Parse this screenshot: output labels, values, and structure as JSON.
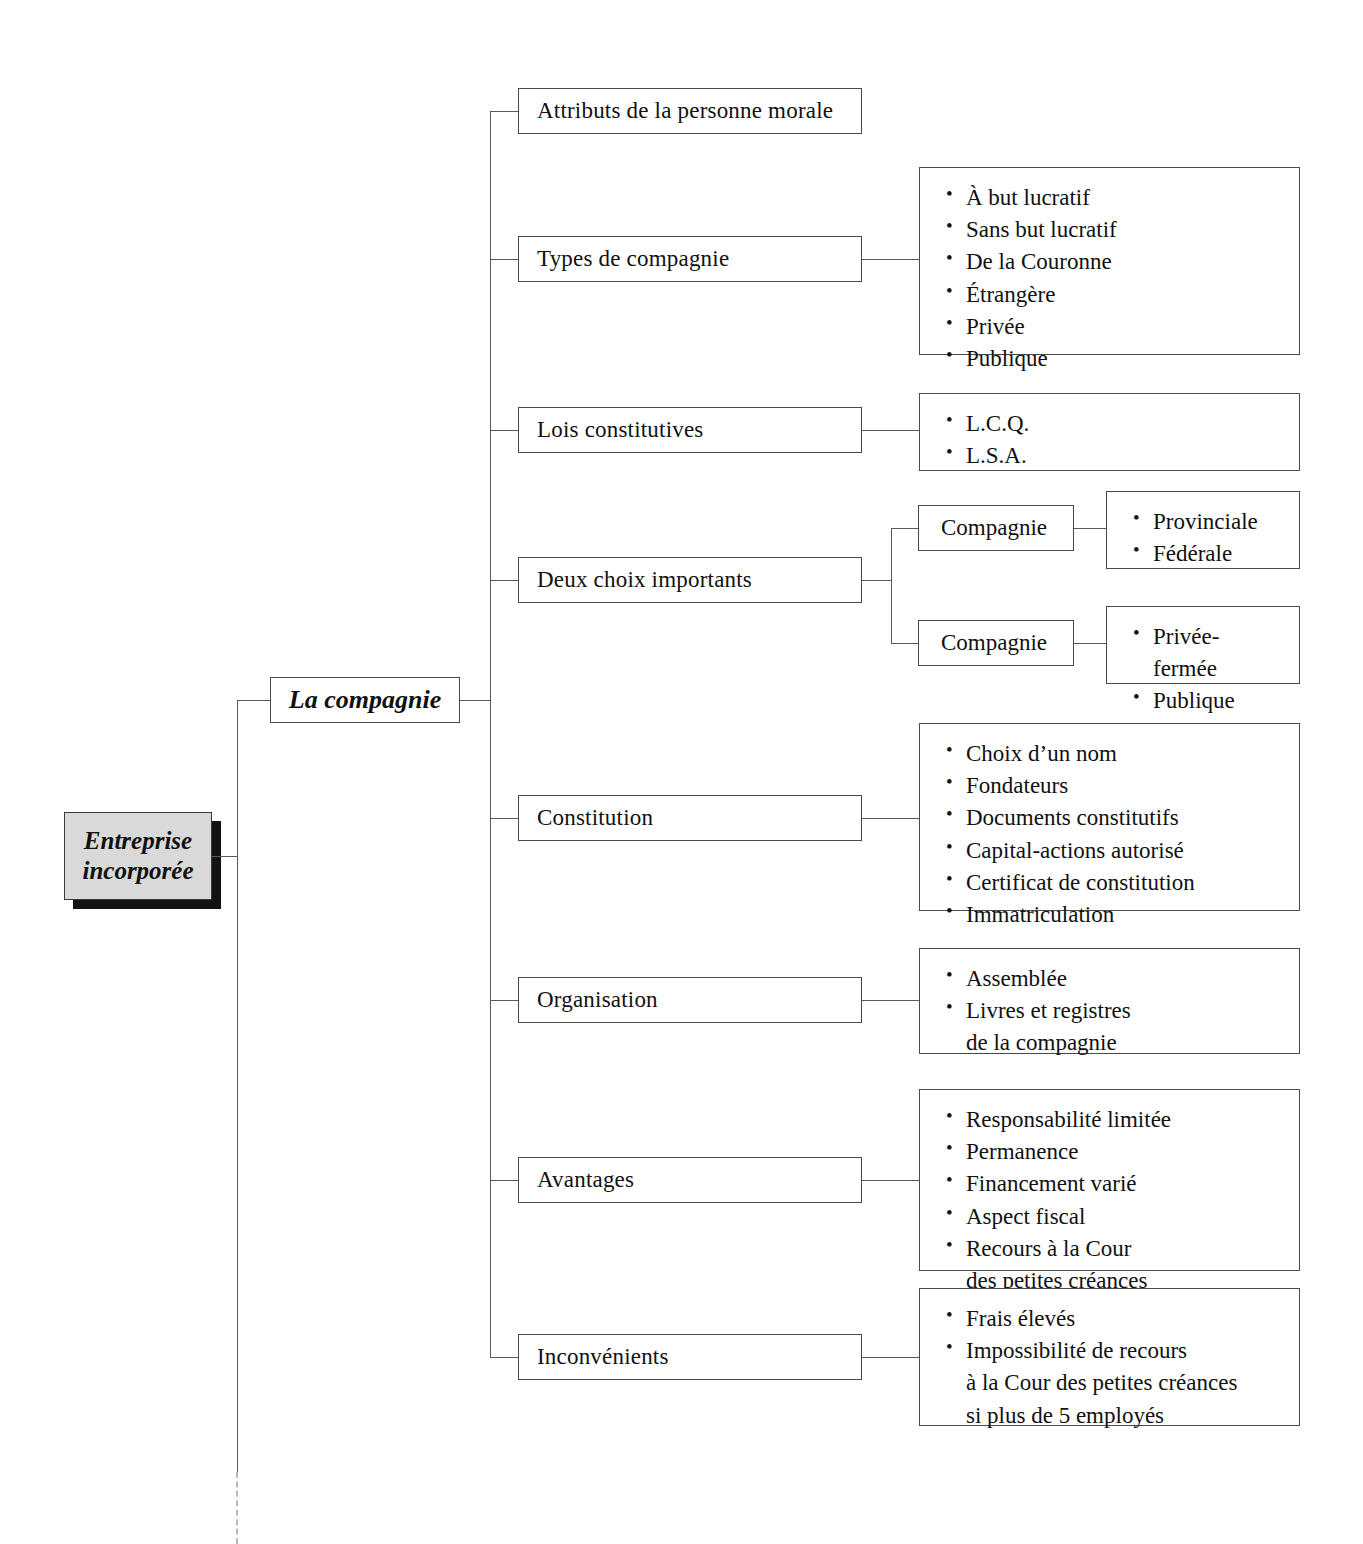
{
  "diagram": {
    "title": "Entreprise incorporée",
    "root": {
      "line1": "Entreprise",
      "line2": "incorporée"
    },
    "trunk": {
      "label": "La compagnie"
    },
    "branches": [
      {
        "label": "Attributs de la personne morale",
        "items": []
      },
      {
        "label": "Types de compagnie",
        "items": [
          "À but lucratif",
          "Sans but lucratif",
          "De la Couronne",
          "Étrangère",
          "Privée",
          "Publique"
        ]
      },
      {
        "label": "Lois constitutives",
        "items": [
          "L.C.Q.",
          "L.S.A."
        ]
      },
      {
        "label": "Deux choix importants",
        "sub": [
          {
            "label": "Compagnie",
            "items": [
              "Provinciale",
              "Fédérale"
            ]
          },
          {
            "label": "Compagnie",
            "items": [
              "Privée-fermée",
              "Publique"
            ]
          }
        ]
      },
      {
        "label": "Constitution",
        "items": [
          "Choix d’un nom",
          "Fondateurs",
          "Documents constitutifs",
          "Capital-actions autorisé",
          "Certificat de constitution",
          "Immatriculation"
        ]
      },
      {
        "label": "Organisation",
        "items": [
          "Assemblée",
          "Livres et registres\nde la compagnie"
        ]
      },
      {
        "label": "Avantages",
        "items": [
          "Responsabilité limitée",
          "Permanence",
          "Financement varié",
          "Aspect fiscal",
          "Recours à la Cour\ndes petites créances"
        ]
      },
      {
        "label": "Inconvénients",
        "items": [
          "Frais élevés",
          "Impossibilité de recours\nà la Cour des petites créances\nsi plus de 5 employés"
        ]
      }
    ],
    "colors": {
      "line": "#5a5a5a",
      "border": "#4a4a4a",
      "root_fill": "#d9d9d9",
      "root_shadow": "#131313",
      "dashed": "#b9b9b9",
      "text": "#111111"
    }
  }
}
